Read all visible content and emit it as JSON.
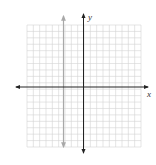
{
  "diagram": {
    "type": "coordinate-grid",
    "axes": {
      "x_label": "x",
      "y_label": "y"
    },
    "grid": {
      "columns": 18,
      "rows": 19,
      "line_color": "#d4d4d4"
    },
    "colors": {
      "axis": "#222222",
      "gray_line": "#a8a8a8"
    },
    "vertical_gray_line": {
      "description": "vertical line with arrows, left of y-axis",
      "grid_offset_from_y_axis": -3
    }
  }
}
